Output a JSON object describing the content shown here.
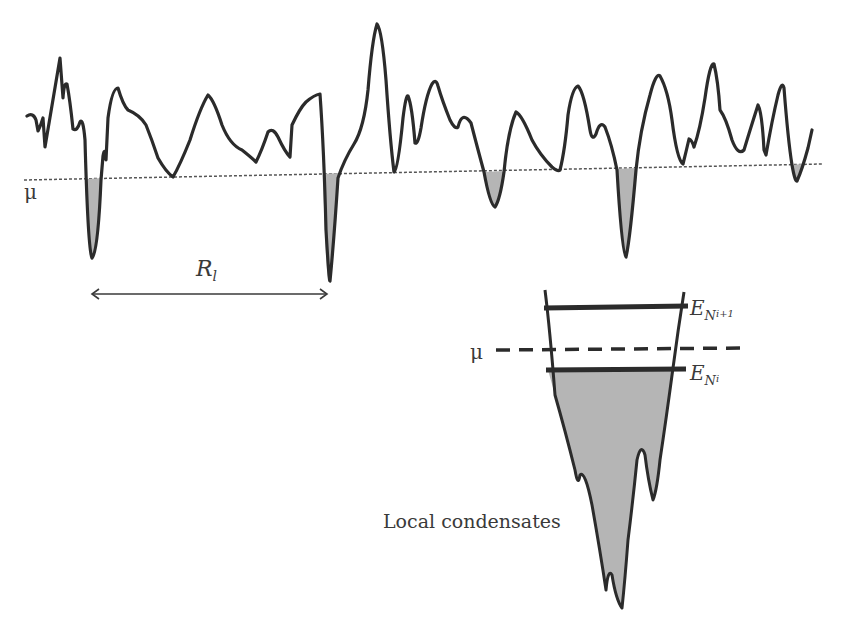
{
  "figure": {
    "top_panel": {
      "mu_label": "μ",
      "distance_label": "R",
      "distance_label_subscript": "l",
      "chemical_potential_line": "dotted",
      "curve_color": "#2b2b2b",
      "fill_color": "#b5b5b5"
    },
    "bottom_panel": {
      "mu_label": "μ",
      "upper_level_label": "E",
      "upper_level_subscript": "N",
      "upper_level_subsubscript": "i+1",
      "lower_level_label": "E",
      "lower_level_subscript": "N",
      "lower_level_subsubscript": "i",
      "annotation": "Local condensates",
      "fill_color": "#b5b5b5"
    }
  }
}
